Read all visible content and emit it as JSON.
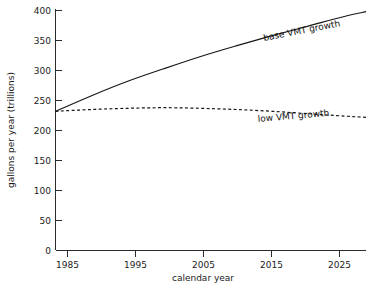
{
  "chart_data": {
    "type": "line",
    "title": "",
    "subtitle": "",
    "xlabel": "calendar year",
    "ylabel": "gallons per year (trillions)",
    "xlim": [
      1985,
      2028
    ],
    "ylim": [
      0,
      400
    ],
    "xticks": [
      1985,
      1995,
      2005,
      2015,
      2025
    ],
    "xtick_labels": [
      "1985",
      "1995",
      "2005",
      "2015",
      "2025"
    ],
    "yticks": [
      0,
      50,
      100,
      150,
      200,
      250,
      300,
      350,
      400
    ],
    "ytick_labels": [
      "0",
      "50",
      "100",
      "150",
      "200",
      "250",
      "300",
      "350",
      "400"
    ],
    "grid": false,
    "legend_position": "inline-annotation",
    "x": [
      1985,
      1990,
      1995,
      2000,
      2005,
      2010,
      2015,
      2020,
      2025,
      2028
    ],
    "series": [
      {
        "name": "base VMT growth",
        "style": "solid",
        "color": "#171717",
        "label": "base VMT growth",
        "values": [
          232,
          258,
          282,
          303,
          323,
          341,
          358,
          374,
          390,
          398
        ]
      },
      {
        "name": "low VMT growth",
        "style": "dashed",
        "color": "#171717",
        "label": "low VMT growth",
        "values": [
          232,
          235,
          237,
          238,
          237,
          235,
          232,
          228,
          224,
          222
        ]
      }
    ],
    "annotations": [
      {
        "text": "base VMT growth",
        "x": 2013,
        "y": 364
      },
      {
        "text": "low VMT growth",
        "x": 2012,
        "y": 218
      }
    ]
  },
  "axes": {
    "y_axis_title": "gallons per year (trillions)",
    "x_axis_title": "calendar year"
  }
}
